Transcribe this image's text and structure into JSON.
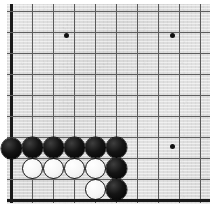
{
  "app": {
    "title": "Go Board Diagram",
    "description": "Lower-left corner of a Go board showing a wall of black stones over a line of white stones"
  },
  "board": {
    "label": "go-board",
    "background_color": "#dedede",
    "line_color": "#595959",
    "edge_color": "#1a1a1a",
    "black_color": "#000000",
    "white_color": "#ffffff",
    "origin_x": 11,
    "origin_y": 11,
    "spacing": 21,
    "columns": 10,
    "rows": 10,
    "left_edge_index": 0,
    "bottom_edge_index": 9,
    "vertical_lines": [
      11,
      32,
      53,
      74,
      95,
      116,
      137,
      158,
      179,
      200
    ],
    "horizontal_lines": [
      11,
      32,
      53,
      74,
      95,
      116,
      137,
      158,
      179,
      200
    ],
    "star_points": [
      {
        "name": "star-point-upper-left",
        "x": 66,
        "y": 35
      },
      {
        "name": "star-point-upper-right",
        "x": 172,
        "y": 35
      },
      {
        "name": "star-point-lower-right",
        "x": 172,
        "y": 146
      }
    ],
    "stones": [
      {
        "name": "black-stone-a1",
        "color": "black",
        "x": 11,
        "y": 148
      },
      {
        "name": "black-stone-b1",
        "color": "black",
        "x": 32,
        "y": 147
      },
      {
        "name": "black-stone-c1",
        "color": "black",
        "x": 53,
        "y": 147
      },
      {
        "name": "black-stone-d1",
        "color": "black",
        "x": 74,
        "y": 147
      },
      {
        "name": "black-stone-e1",
        "color": "black",
        "x": 95,
        "y": 147
      },
      {
        "name": "black-stone-f1",
        "color": "black",
        "x": 116,
        "y": 147
      },
      {
        "name": "white-stone-b2",
        "color": "white",
        "x": 32,
        "y": 168
      },
      {
        "name": "white-stone-c2",
        "color": "white",
        "x": 53,
        "y": 168
      },
      {
        "name": "white-stone-d2",
        "color": "white",
        "x": 74,
        "y": 168
      },
      {
        "name": "white-stone-e2",
        "color": "white",
        "x": 95,
        "y": 168
      },
      {
        "name": "black-stone-f2",
        "color": "black",
        "x": 116,
        "y": 168
      },
      {
        "name": "white-stone-e3",
        "color": "white",
        "x": 95,
        "y": 189
      },
      {
        "name": "black-stone-f3",
        "color": "black",
        "x": 116,
        "y": 189
      }
    ],
    "counts": {
      "black_stones": 8,
      "white_stones": 5,
      "total_stones": 13
    }
  }
}
